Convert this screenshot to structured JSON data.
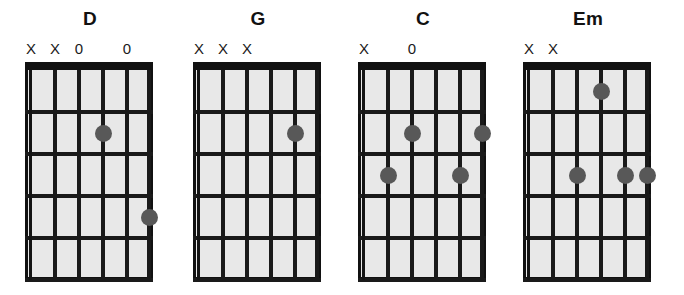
{
  "figure": {
    "title": "",
    "background_color": "#ffffff",
    "dot_color": "#585858",
    "line_color": "#1a1a1a",
    "board_color": "#e8e8e8"
  },
  "chart_data": {
    "type": "diagram",
    "subtype": "guitar-chord-chart",
    "title": "",
    "strings": 6,
    "frets": 5,
    "string_order": "low-to-high-left-to-right",
    "marker_symbols": {
      "muted": "X",
      "open": "0"
    },
    "chords": [
      {
        "name": "D",
        "markers": [
          "X",
          "X",
          "0",
          "",
          "0",
          ""
        ],
        "dots": [
          {
            "string": 4,
            "fret": 2
          },
          {
            "string": 6,
            "fret": 4
          }
        ]
      },
      {
        "name": "G",
        "markers": [
          "X",
          "X",
          "X",
          "",
          "",
          ""
        ],
        "dots": [
          {
            "string": 5,
            "fret": 2
          }
        ]
      },
      {
        "name": "C",
        "markers": [
          "X",
          "",
          "0",
          "",
          "",
          ""
        ],
        "dots": [
          {
            "string": 3,
            "fret": 2
          },
          {
            "string": 6,
            "fret": 2
          },
          {
            "string": 2,
            "fret": 3
          },
          {
            "string": 5,
            "fret": 3
          }
        ]
      },
      {
        "name": "Em",
        "markers": [
          "X",
          "X",
          "",
          "",
          "",
          ""
        ],
        "dots": [
          {
            "string": 4,
            "fret": 1
          },
          {
            "string": 3,
            "fret": 3
          },
          {
            "string": 5,
            "fret": 3
          },
          {
            "string": 6,
            "fret": 3
          }
        ]
      }
    ]
  },
  "layout": {
    "card_left_offsets": [
      25,
      193,
      358,
      523
    ],
    "string_x": [
      6,
      30,
      54,
      78,
      102,
      124
    ],
    "fret_y": [
      8,
      50,
      92,
      134,
      176,
      218
    ]
  }
}
